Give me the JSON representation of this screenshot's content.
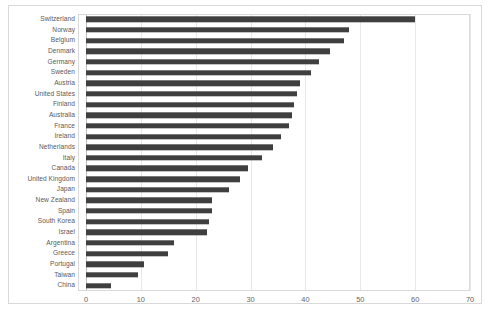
{
  "chart_data": {
    "type": "bar",
    "orientation": "horizontal",
    "title": "",
    "xlabel": "",
    "ylabel": "",
    "xlim": [
      0,
      70
    ],
    "xticks": [
      0,
      10,
      20,
      30,
      40,
      50,
      60,
      70
    ],
    "xtick_labels": [
      "0",
      "10",
      "20",
      "30",
      "40",
      "50",
      "60",
      "70"
    ],
    "grid": true,
    "legend": false,
    "bar_color": "#3f3f3f",
    "categories": [
      "Switzerland",
      "Norway",
      "Belgium",
      "Denmark",
      "Germany",
      "Sweden",
      "Austria",
      "United States",
      "Finland",
      "Australia",
      "France",
      "Ireland",
      "Netherlands",
      "Italy",
      "Canada",
      "United Kingdom",
      "Japan",
      "New Zealand",
      "Spain",
      "South Korea",
      "Israel",
      "Argentina",
      "Greece",
      "Portugal",
      "Taiwan",
      "China"
    ],
    "values": [
      60,
      48,
      47,
      44.5,
      42.5,
      41,
      39,
      38.5,
      38,
      37.5,
      37,
      35.5,
      34,
      32,
      29.5,
      28,
      26,
      23,
      23,
      22.5,
      22,
      16,
      15,
      10.5,
      9.5,
      4.5
    ]
  }
}
